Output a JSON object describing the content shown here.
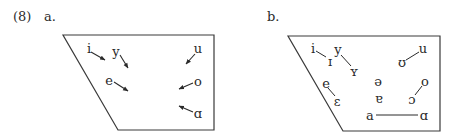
{
  "example_number": "(8)",
  "panels": [
    {
      "label": "a.",
      "vowels": [
        {
          "symbol": "i",
          "x": 89,
          "y": 48
        },
        {
          "symbol": "y",
          "x": 116,
          "y": 51
        },
        {
          "symbol": "u",
          "x": 198,
          "y": 48
        },
        {
          "symbol": "e",
          "x": 109,
          "y": 80
        },
        {
          "symbol": "o",
          "x": 198,
          "y": 81
        },
        {
          "symbol": "ɑ",
          "x": 198,
          "y": 113
        }
      ]
    },
    {
      "label": "b.",
      "vowels": [
        {
          "symbol": "i",
          "x": 313,
          "y": 48
        },
        {
          "symbol": "ɪ",
          "x": 330,
          "y": 61
        },
        {
          "symbol": "y",
          "x": 338,
          "y": 49
        },
        {
          "symbol": "ʏ",
          "x": 354,
          "y": 71
        },
        {
          "symbol": "ʊ",
          "x": 402,
          "y": 62
        },
        {
          "symbol": "u",
          "x": 423,
          "y": 48
        },
        {
          "symbol": "e",
          "x": 326,
          "y": 83
        },
        {
          "symbol": "ɛ",
          "x": 337,
          "y": 101
        },
        {
          "symbol": "ə",
          "x": 378,
          "y": 81
        },
        {
          "symbol": "ɐ",
          "x": 379,
          "y": 98
        },
        {
          "symbol": "o",
          "x": 425,
          "y": 81
        },
        {
          "symbol": "ɔ",
          "x": 412,
          "y": 99
        },
        {
          "symbol": "a",
          "x": 370,
          "y": 115
        },
        {
          "symbol": "ɑ",
          "x": 424,
          "y": 115
        }
      ]
    }
  ]
}
